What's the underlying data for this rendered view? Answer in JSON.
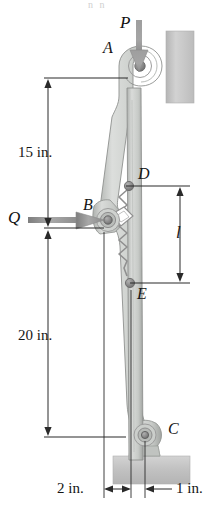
{
  "figure": {
    "background_color": "#ffffff",
    "ghost_caption": "n n"
  },
  "points": [
    {
      "id": "A",
      "label": "A",
      "x": 136,
      "y": 63,
      "role": "top-pin"
    },
    {
      "id": "B",
      "label": "B",
      "x": 108,
      "y": 220,
      "role": "pivot-pin"
    },
    {
      "id": "C",
      "label": "C",
      "x": 144,
      "y": 437,
      "role": "base-pivot"
    },
    {
      "id": "D",
      "label": "D",
      "x": 132,
      "y": 185,
      "role": "spring-top-pin"
    },
    {
      "id": "E",
      "label": "E",
      "x": 131,
      "y": 283,
      "role": "spring-bottom-pin"
    }
  ],
  "forces": [
    {
      "id": "P",
      "label": "P",
      "direction": "down",
      "applied_at": "A"
    },
    {
      "id": "Q",
      "label": "Q",
      "direction": "right",
      "applied_at": "B"
    }
  ],
  "dimensions": [
    {
      "id": "d15",
      "label": "15 in.",
      "orientation": "vertical",
      "from": "A",
      "to": "B",
      "value": 15,
      "unit": "in."
    },
    {
      "id": "d20",
      "label": "20 in.",
      "orientation": "vertical",
      "from": "B",
      "to": "C",
      "value": 20,
      "unit": "in."
    },
    {
      "id": "dl",
      "label": "l",
      "orientation": "vertical",
      "from": "D",
      "to": "E",
      "value": null,
      "unit": ""
    },
    {
      "id": "d2",
      "label": "2 in.",
      "orientation": "horizontal",
      "value": 2,
      "unit": "in."
    },
    {
      "id": "d1",
      "label": "1 in.",
      "orientation": "horizontal",
      "value": 1,
      "unit": "in."
    }
  ],
  "components": [
    {
      "id": "wall",
      "name": "vertical-guide-wall",
      "color": "#c9c9c9"
    },
    {
      "id": "lever",
      "name": "curved-lever-arm",
      "color": "#c4c7c4"
    },
    {
      "id": "link",
      "name": "vertical-link",
      "color": "#c6c9c6"
    },
    {
      "id": "spring",
      "name": "coil-spring",
      "color": "#8d8d8d"
    },
    {
      "id": "base",
      "name": "base-support-block",
      "color": "#c3c3c3"
    },
    {
      "id": "bracket",
      "name": "base-bracket",
      "color": "#bdbdbd"
    }
  ],
  "colors": {
    "line": "#2a2a2a",
    "arrow_fill": "#9a9a9a",
    "metal_light": "#d8dad8",
    "metal_mid": "#bfc2bf",
    "metal_dark": "#9a9d9a",
    "pin": "#8b8b8b",
    "wall": "#c9c9c9",
    "base": "#c3c3c3"
  }
}
